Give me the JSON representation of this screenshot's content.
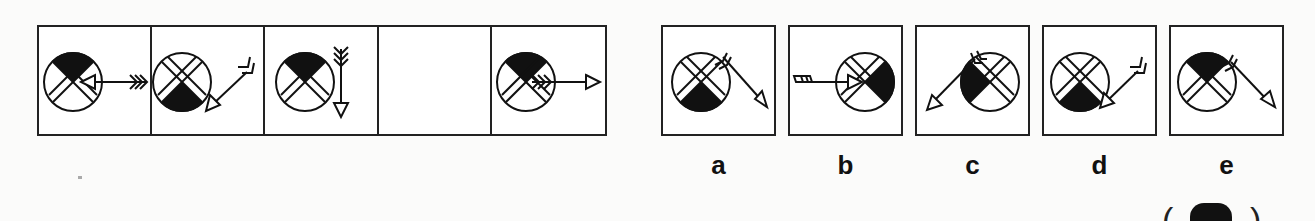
{
  "puzzle": {
    "type": "figure-series-completion",
    "sequence": [
      {
        "index": 1,
        "shaded_quadrant": "top",
        "arrow": "horizontal, pointing left into circle from right"
      },
      {
        "index": 2,
        "shaded_quadrant": "bottom",
        "arrow": "diagonal, pointing down-left into circle from upper right"
      },
      {
        "index": 3,
        "shaded_quadrant": "top",
        "arrow": "vertical, pointing down, beside circle on right"
      },
      {
        "index": 4,
        "shaded_quadrant": "",
        "arrow": "",
        "missing": true
      },
      {
        "index": 5,
        "shaded_quadrant": "top",
        "arrow": "horizontal, pointing right, fletching inside circle"
      }
    ],
    "options": [
      {
        "label": "a",
        "shaded_quadrant": "bottom",
        "arrow": "diagonal, pointing down-right, fletching at top of circle"
      },
      {
        "label": "b",
        "shaded_quadrant": "right",
        "arrow": "horizontal, pointing right into circle from left"
      },
      {
        "label": "c",
        "shaded_quadrant": "left",
        "arrow": "diagonal, pointing down-left, fletching at top of circle"
      },
      {
        "label": "d",
        "shaded_quadrant": "bottom",
        "arrow": "diagonal, pointing down-left into circle from upper right"
      },
      {
        "label": "e",
        "shaded_quadrant": "top",
        "arrow": "diagonal, pointing down-right, fletching at top right of circle"
      }
    ],
    "answer_bracket": "(   )"
  }
}
